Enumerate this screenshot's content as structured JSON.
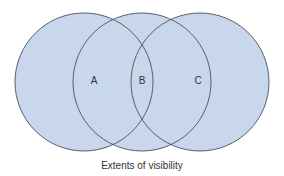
{
  "diagram": {
    "type": "venn",
    "fill_color": "#c8d7ec",
    "stroke_color": "#4a4f5a",
    "circles": [
      {
        "id": "left",
        "cx": 84,
        "cy": 82,
        "r": 69
      },
      {
        "id": "middle",
        "cx": 142,
        "cy": 82,
        "r": 69
      },
      {
        "id": "right",
        "cx": 200,
        "cy": 82,
        "r": 69
      }
    ],
    "labels": {
      "a": "A",
      "b": "B",
      "c": "C"
    },
    "caption": "Extents of visibility"
  }
}
